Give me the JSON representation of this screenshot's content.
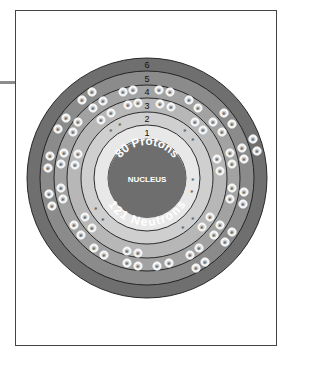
{
  "diagram": {
    "nucleus": {
      "label": "NUCLEUS",
      "protons_label": "80 Protons",
      "neutrons_label": "121 Neutrons",
      "color": "#6e6e6e"
    },
    "center": {
      "x": 147,
      "y": 178
    },
    "shells": [
      {
        "n": "1",
        "r_outer": 53,
        "color": "#e8e8e8",
        "electrons": 2
      },
      {
        "n": "2",
        "r_outer": 66,
        "color": "#cfcfcf",
        "electrons": 8
      },
      {
        "n": "3",
        "r_outer": 80,
        "color": "#b7b7b7",
        "electrons": 18
      },
      {
        "n": "4",
        "r_outer": 93,
        "color": "#a2a2a2",
        "electrons": 32
      },
      {
        "n": "5",
        "r_outer": 107,
        "color": "#8b8b8b",
        "electrons": 18
      },
      {
        "n": "6",
        "r_outer": 120,
        "color": "#6f6f6f",
        "electrons": 2
      }
    ],
    "electron_symbol": "e",
    "small_electrons": [
      [
        193,
        179
      ],
      [
        192,
        191
      ],
      [
        111,
        130
      ],
      [
        120,
        124
      ],
      [
        185,
        130
      ],
      [
        193,
        139
      ],
      [
        96,
        208
      ],
      [
        103,
        219
      ],
      [
        193,
        218
      ],
      [
        183,
        227
      ]
    ],
    "circled_electrons": [
      [
        92,
        92
      ],
      [
        82,
        100
      ],
      [
        66,
        118
      ],
      [
        58,
        129
      ],
      [
        50,
        156
      ],
      [
        48,
        168
      ],
      [
        123,
        92
      ],
      [
        133,
        90
      ],
      [
        103,
        101
      ],
      [
        93,
        108
      ],
      [
        78,
        122
      ],
      [
        73,
        132
      ],
      [
        64,
        153
      ],
      [
        61,
        164
      ],
      [
        128,
        105
      ],
      [
        138,
        103
      ],
      [
        111,
        113
      ],
      [
        101,
        120
      ],
      [
        78,
        154
      ],
      [
        75,
        165
      ],
      [
        159,
        90
      ],
      [
        170,
        92
      ],
      [
        189,
        100
      ],
      [
        198,
        108
      ],
      [
        213,
        122
      ],
      [
        222,
        132
      ],
      [
        230,
        153
      ],
      [
        232,
        164
      ],
      [
        160,
        104
      ],
      [
        171,
        107
      ],
      [
        195,
        122
      ],
      [
        203,
        130
      ],
      [
        217,
        159
      ],
      [
        220,
        171
      ],
      [
        224,
        113
      ],
      [
        232,
        124
      ],
      [
        242,
        148
      ],
      [
        244,
        159
      ],
      [
        253,
        139
      ],
      [
        257,
        151
      ],
      [
        49,
        194
      ],
      [
        52,
        206
      ],
      [
        94,
        248
      ],
      [
        104,
        255
      ],
      [
        127,
        263
      ],
      [
        138,
        266
      ],
      [
        61,
        188
      ],
      [
        63,
        199
      ],
      [
        74,
        225
      ],
      [
        81,
        235
      ],
      [
        85,
        217
      ],
      [
        92,
        228
      ],
      [
        127,
        251
      ],
      [
        138,
        253
      ],
      [
        210,
        217
      ],
      [
        202,
        227
      ],
      [
        199,
        248
      ],
      [
        190,
        255
      ],
      [
        232,
        188
      ],
      [
        230,
        199
      ],
      [
        220,
        225
      ],
      [
        214,
        235
      ],
      [
        205,
        262
      ],
      [
        196,
        268
      ],
      [
        244,
        192
      ],
      [
        243,
        204
      ],
      [
        232,
        232
      ],
      [
        225,
        242
      ],
      [
        157,
        266
      ],
      [
        169,
        263
      ]
    ]
  }
}
